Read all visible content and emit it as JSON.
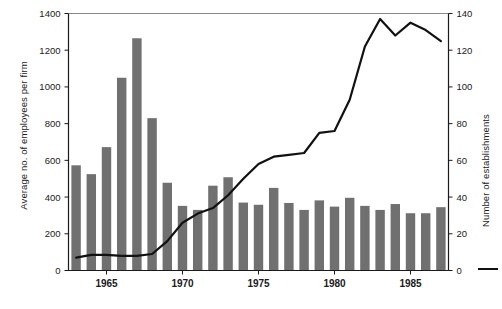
{
  "chart_data": {
    "type": "bar",
    "title": "",
    "xlabel": "",
    "ylabel": "Average no. of employees per firm",
    "y2label": "Number of establishments",
    "grid": false,
    "legend_position": "right",
    "ylim": [
      0,
      1400
    ],
    "y2lim": [
      0,
      140
    ],
    "xlim": [
      1962.5,
      1987.5
    ],
    "y_ticks": [
      0,
      200,
      400,
      600,
      800,
      1000,
      1200,
      1400
    ],
    "y2_ticks": [
      0,
      20,
      40,
      60,
      80,
      100,
      120,
      140
    ],
    "x_ticks": [
      1965,
      1970,
      1975,
      1980,
      1985
    ],
    "x_tick_labels": [
      "1965",
      "1970",
      "1975",
      "1980",
      "1985"
    ],
    "categories": [
      1963,
      1964,
      1965,
      1966,
      1967,
      1968,
      1969,
      1970,
      1971,
      1972,
      1973,
      1974,
      1975,
      1976,
      1977,
      1978,
      1979,
      1980,
      1981,
      1982,
      1983,
      1984,
      1985,
      1986,
      1987
    ],
    "series": [
      {
        "name": "Average no. of employees per firm",
        "type": "bar",
        "axis": "left",
        "color": "#707070",
        "values": [
          573,
          525,
          672,
          1050,
          1265,
          830,
          478,
          352,
          330,
          462,
          508,
          370,
          358,
          450,
          368,
          330,
          382,
          348,
          396,
          352,
          330,
          362,
          312,
          312,
          345
        ]
      },
      {
        "name": "Number of establishments",
        "type": "line",
        "axis": "right",
        "color": "#111111",
        "values": [
          7,
          8.5,
          8.5,
          8,
          8,
          9,
          16,
          26,
          31,
          34,
          41,
          50,
          58,
          62,
          63,
          64,
          75,
          76,
          93,
          122,
          137,
          128,
          135,
          131,
          125
        ]
      }
    ]
  },
  "axes": {
    "left_title": "Average no. of employees per firm",
    "right_title": "Number of establishments"
  },
  "legend": {
    "line_entry": "Number of establishments"
  }
}
